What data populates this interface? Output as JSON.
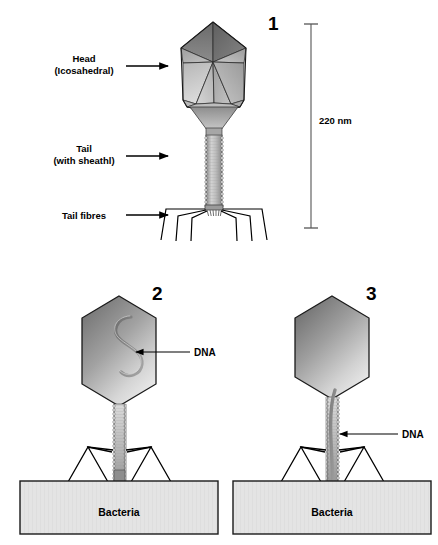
{
  "figure": {
    "background_color": "#ffffff",
    "line_color": "#000000"
  },
  "panels": [
    {
      "id": "panel-1",
      "number": "1",
      "number_x": 268,
      "number_y": 30,
      "caption": "Phage structure with labelled parts and scale bar"
    },
    {
      "id": "panel-2",
      "number": "2",
      "number_x": 152,
      "number_y": 300,
      "caption": "Phage attached to bacterium, DNA still inside head"
    },
    {
      "id": "panel-3",
      "number": "3",
      "number_x": 366,
      "number_y": 300,
      "caption": "Phage injecting DNA into bacterium, head empty"
    }
  ],
  "labels": {
    "head_line1": "Head",
    "head_line2": "(Icosahedral)",
    "tail_line1": "Tail",
    "tail_line2": "(with sheathl)",
    "tail_fibres": "Tail fibres",
    "dna_panel2": "DNA",
    "dna_panel3": "DNA",
    "bacteria_panel2": "Bacteria",
    "bacteria_panel3": "Bacteria"
  },
  "scale_bar": {
    "value": "220 nm",
    "top_y": 24,
    "bottom_y": 228,
    "x": 311
  },
  "colors": {
    "outline": "#000000",
    "head_dark": "#6e6e6e",
    "head_mid": "#8f8f8f",
    "head_light": "#c2c2c2",
    "head_lightest": "#dcdcdc",
    "tail_gray": "#9a9a9a",
    "dna_gray": "#8a8a8a",
    "bacteria_fill": "#e4e4e4",
    "white": "#ffffff"
  },
  "structure": {
    "head_shape_panel1": "icosahedron",
    "head_shape_panel2": "hexagon",
    "head_shape_panel3": "hexagon",
    "tail_type": "striated sheath with beaded edges",
    "tail_fibre_count_panel1": 6,
    "tail_fibre_count_panel2": 4,
    "tail_fibre_count_panel3": 4
  }
}
